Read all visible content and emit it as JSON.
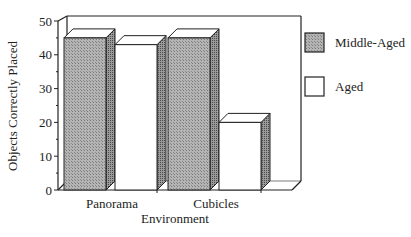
{
  "chart_data": {
    "type": "bar",
    "style": "3d-grouped",
    "title": "",
    "xlabel": "Environment",
    "ylabel": "Objects Correctly Placed",
    "ylim": [
      0,
      50
    ],
    "yticks": [
      0,
      10,
      20,
      30,
      40,
      50
    ],
    "categories": [
      "Panorama",
      "Cubicles"
    ],
    "series": [
      {
        "name": "Middle-Aged",
        "values": [
          45,
          45
        ],
        "fill": "hatched-gray"
      },
      {
        "name": "Aged",
        "values": [
          43,
          20
        ],
        "fill": "white"
      }
    ],
    "legend_position": "right",
    "grid": false
  },
  "colors": {
    "axis": "#222222",
    "middle_aged_fill": "#a8a8a8",
    "aged_fill": "#ffffff",
    "side_shade": "#8a8a8a"
  }
}
